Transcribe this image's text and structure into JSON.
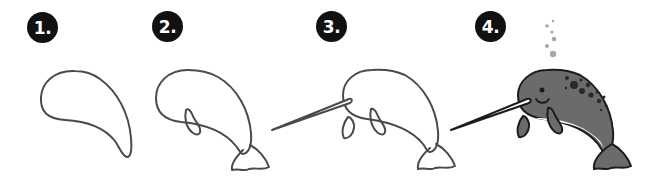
{
  "tutorial": {
    "subject": "narwhal",
    "steps": [
      {
        "number": "1.",
        "description": "teardrop body outline"
      },
      {
        "number": "2.",
        "description": "body with flipper and tail fin"
      },
      {
        "number": "3.",
        "description": "add head, tusk and second flipper"
      },
      {
        "number": "4.",
        "description": "colored narwhal with eye, smile, spots and bubbles"
      }
    ]
  },
  "colors": {
    "outline": "#4a4a4a",
    "badge_bg": "#111111",
    "badge_text": "#ffffff",
    "body_fill": "#6b6b6b",
    "belly_fill": "#ffffff",
    "spots": "#2a2a2a",
    "bubbles": "#a8a8a8",
    "tusk_fill": "#ffffff"
  }
}
